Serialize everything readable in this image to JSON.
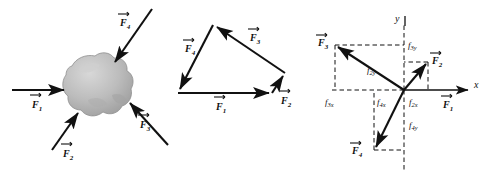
{
  "figure": {
    "panels": [
      {
        "id": "rock",
        "name": "free-body-rock"
      },
      {
        "id": "polygon",
        "name": "vector-polygon"
      },
      {
        "id": "components",
        "name": "component-axes"
      }
    ]
  },
  "colors": {
    "ink": "#111111",
    "rock_fill": "#b9b9b9",
    "rock_light": "#d2d2d2",
    "rock_shadow": "#8f8f8f",
    "background": "#ffffff"
  },
  "panel_rock": {
    "name": "free-body-diagram",
    "object_label": "rock",
    "vectors": [
      {
        "name": "F1",
        "base": "F",
        "sub": "1",
        "label": "f1-label",
        "direction": "right",
        "description": "horizontal force pointing right into rock"
      },
      {
        "name": "F2",
        "base": "F",
        "sub": "2",
        "label": "f2-label",
        "direction": "up-right",
        "description": "force from lower-left pointing up-right into rock"
      },
      {
        "name": "F3",
        "base": "F",
        "sub": "3",
        "label": "f3-label",
        "direction": "up-left",
        "description": "force from lower-right pointing up-left into rock"
      },
      {
        "name": "F4",
        "base": "F",
        "sub": "4",
        "label": "f4-label",
        "direction": "down-left",
        "description": "force from upper-right pointing down-left into rock"
      }
    ]
  },
  "panel_polygon": {
    "name": "tip-to-tail-vector-polygon",
    "vectors": [
      {
        "name": "F1",
        "base": "F",
        "sub": "1",
        "label": "f1-label",
        "from": [
          10,
          93
        ],
        "to": [
          104,
          93
        ]
      },
      {
        "name": "F2",
        "base": "F",
        "sub": "2",
        "label": "f2-label",
        "from": [
          104,
          93
        ],
        "to": [
          117,
          73
        ]
      },
      {
        "name": "F3",
        "base": "F",
        "sub": "3",
        "label": "f3-label",
        "from": [
          117,
          73
        ],
        "to": [
          45,
          25
        ]
      },
      {
        "name": "F4",
        "base": "F",
        "sub": "4",
        "label": "f4-label",
        "from": [
          45,
          25
        ],
        "to": [
          10,
          93
        ]
      }
    ],
    "closure": "closed polygon, resultant zero"
  },
  "panel_components": {
    "name": "component-resolution-diagram",
    "axes": {
      "x_label": "x",
      "y_label": "y",
      "origin": [
        100,
        90
      ]
    },
    "vectors": [
      {
        "name": "F1",
        "base": "F",
        "sub": "1",
        "label": "f1-label",
        "tip": [
          170,
          90
        ],
        "note": "along +x"
      },
      {
        "name": "F2",
        "base": "F",
        "sub": "2",
        "label": "f2-label",
        "tip": [
          124,
          62
        ],
        "note": "first quadrant"
      },
      {
        "name": "F3",
        "base": "F",
        "sub": "3",
        "label": "f3-label",
        "tip": [
          31,
          45
        ],
        "note": "second quadrant"
      },
      {
        "name": "F4",
        "base": "F",
        "sub": "4",
        "label": "f4-label",
        "tip": [
          70,
          150
        ],
        "note": "third quadrant"
      }
    ],
    "components": [
      {
        "name": "f3y",
        "base": "f",
        "sub": "3y",
        "label": "f3y-label"
      },
      {
        "name": "f2y",
        "base": "f",
        "sub": "2y",
        "label": "f2y-label"
      },
      {
        "name": "f3x",
        "base": "f",
        "sub": "3x",
        "label": "f3x-label"
      },
      {
        "name": "f4x",
        "base": "f",
        "sub": "4x",
        "label": "f4x-label"
      },
      {
        "name": "f2x",
        "base": "f",
        "sub": "2x",
        "label": "f2x-label"
      },
      {
        "name": "f4y",
        "base": "f",
        "sub": "4y",
        "label": "f4y-label"
      }
    ]
  },
  "labels": {
    "F": "F",
    "f": "f",
    "one": "1",
    "two": "2",
    "three": "3",
    "four": "4",
    "x": "x",
    "y": "y",
    "f3y": "3y",
    "f2y": "2y",
    "f3x": "3x",
    "f4x": "4x",
    "f2x": "2x",
    "f4y": "4y"
  }
}
